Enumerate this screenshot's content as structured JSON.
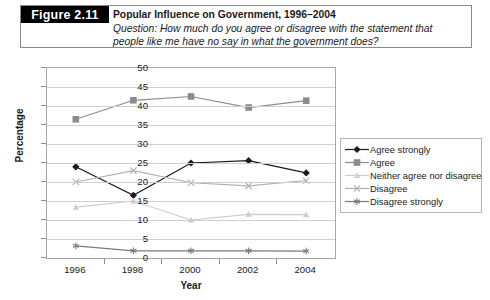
{
  "caption": {
    "figure_tag": "Figure 2.11",
    "title": "Popular Influence on Government, 1996–2004",
    "question": "Question: How much do you agree or disagree with the statement that people like me have no say in what the government does?"
  },
  "chart_data": {
    "type": "line",
    "title": "Popular Influence on Government, 1996–2004",
    "xlabel": "Year",
    "ylabel": "Percentage",
    "categories": [
      "1996",
      "1998",
      "2000",
      "2002",
      "2004"
    ],
    "x": [
      1996,
      1998,
      2000,
      2002,
      2004
    ],
    "ylim": [
      0,
      50
    ],
    "yticks": [
      "0",
      "5",
      "10",
      "15",
      "20",
      "25",
      "30",
      "35",
      "40",
      "45",
      "50"
    ],
    "grid": "horizontal",
    "legend_position": "right",
    "series": [
      {
        "name": "Agree strongly",
        "marker": "diamond",
        "color": "#1a1a1a",
        "values": [
          24.0,
          16.5,
          25.0,
          25.6,
          22.4
        ]
      },
      {
        "name": "Agree",
        "marker": "square",
        "color": "#8c8c8c",
        "values": [
          36.5,
          41.5,
          42.5,
          39.6,
          41.4
        ]
      },
      {
        "name": "Neither agree nor disagree",
        "marker": "triangle",
        "color": "#cdcdcd",
        "values": [
          13.4,
          15.0,
          10.0,
          11.5,
          11.4
        ]
      },
      {
        "name": "Disagree",
        "marker": "cross",
        "color": "#b0b0b0",
        "values": [
          20.0,
          23.0,
          19.8,
          19.0,
          20.4
        ]
      },
      {
        "name": "Disagree strongly",
        "marker": "asterisk",
        "color": "#7a7a7a",
        "values": [
          3.2,
          1.9,
          1.9,
          1.9,
          1.8
        ]
      }
    ]
  }
}
